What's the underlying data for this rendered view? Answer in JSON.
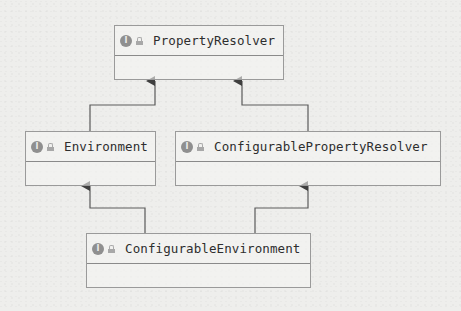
{
  "diagram": {
    "type": "uml-class-hierarchy",
    "nodes": [
      {
        "id": "property-resolver",
        "name": "PropertyResolver",
        "kind": "interface",
        "icon": "interface-icon",
        "visibility_icon": "lock-icon"
      },
      {
        "id": "environment",
        "name": "Environment",
        "kind": "interface",
        "icon": "interface-icon",
        "visibility_icon": "lock-icon"
      },
      {
        "id": "configurable-property-resolver",
        "name": "ConfigurablePropertyResolver",
        "kind": "interface",
        "icon": "interface-icon",
        "visibility_icon": "lock-icon"
      },
      {
        "id": "configurable-environment",
        "name": "ConfigurableEnvironment",
        "kind": "interface",
        "icon": "interface-icon",
        "visibility_icon": "lock-icon"
      }
    ],
    "edges": [
      {
        "from": "environment",
        "to": "property-resolver",
        "type": "extends"
      },
      {
        "from": "configurable-property-resolver",
        "to": "property-resolver",
        "type": "extends"
      },
      {
        "from": "configurable-environment",
        "to": "environment",
        "type": "extends"
      },
      {
        "from": "configurable-environment",
        "to": "configurable-property-resolver",
        "type": "extends"
      }
    ],
    "icon_letter": "I",
    "colors": {
      "background": "#eeeeec",
      "border": "#9a9a9a",
      "line": "#555555",
      "icon_fill": "#8f8f8f",
      "text": "#2e2e2e"
    }
  }
}
